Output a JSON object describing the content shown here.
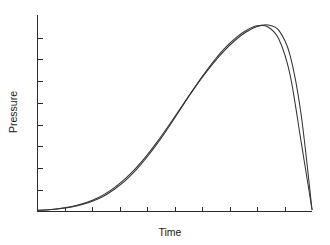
{
  "chart_data": {
    "type": "line",
    "title": "",
    "subtitle": "",
    "xlabel": "Time",
    "ylabel": "Pressure",
    "grid": false,
    "legend": "none",
    "x_tick_labels": [],
    "y_tick_labels": [],
    "x_tick_count": 9,
    "y_tick_count": 8,
    "xlim": [
      0,
      100
    ],
    "ylim": [
      0,
      100
    ],
    "x": [
      0,
      4,
      8,
      12,
      16,
      20,
      24,
      28,
      32,
      36,
      40,
      44,
      48,
      52,
      56,
      60,
      64,
      68,
      72,
      76,
      80,
      84,
      88,
      92,
      96,
      100
    ],
    "series": [
      {
        "name": "curve-a",
        "color": "#333333",
        "values": [
          0.6,
          0.9,
          1.5,
          2.4,
          3.8,
          5.8,
          8.5,
          12.2,
          16.8,
          22.4,
          29.0,
          36.4,
          44.4,
          52.6,
          60.8,
          68.6,
          75.8,
          82.2,
          87.6,
          91.8,
          94.6,
          95.4,
          92.5,
          80.0,
          50.0,
          1.0
        ]
      },
      {
        "name": "curve-b",
        "color": "#333333",
        "values": [
          0.6,
          0.9,
          1.4,
          2.2,
          3.4,
          5.2,
          7.8,
          11.4,
          15.8,
          21.4,
          28.0,
          35.4,
          43.6,
          52.2,
          60.8,
          69.0,
          76.6,
          83.2,
          88.6,
          92.6,
          95.0,
          94.4,
          88.0,
          70.0,
          36.0,
          1.0
        ]
      }
    ],
    "colors": {
      "background": "#ffffff",
      "axis": "#2b2b2b",
      "curve": "#333333",
      "text": "#1a1a1a"
    }
  }
}
